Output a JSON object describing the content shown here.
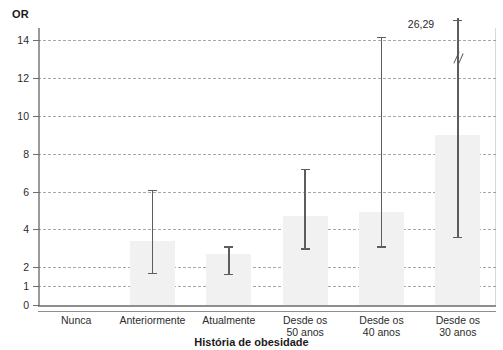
{
  "chart_data": {
    "type": "bar",
    "title": "",
    "subtitle": "",
    "xlabel": "História de obesidade",
    "ylabel": "OR",
    "ylim": [
      0,
      15
    ],
    "grid": true,
    "legend": "none",
    "yticks": [
      0,
      1,
      2,
      4,
      6,
      8,
      10,
      12,
      14
    ],
    "ytick_labels": [
      "0",
      "1",
      "2",
      "4",
      "6",
      "8",
      "10",
      "12",
      "14"
    ],
    "categories": [
      "Nunca",
      "Anteriormente",
      "Atualmente",
      "Desde os 50 anos",
      "Desde os 40 anos",
      "Desde os 30 anos"
    ],
    "category_lines": [
      [
        "Nunca"
      ],
      [
        "Anteriormente"
      ],
      [
        "Atualmente"
      ],
      [
        "Desde os",
        "50 anos"
      ],
      [
        "Desde os",
        "40 anos"
      ],
      [
        "Desde os",
        "30 anos"
      ]
    ],
    "values": [
      1.0,
      3.4,
      2.7,
      4.7,
      4.9,
      9.0
    ],
    "error_low": [
      null,
      1.7,
      1.65,
      3.0,
      3.1,
      3.6
    ],
    "error_high": [
      null,
      6.1,
      3.1,
      7.2,
      14.2,
      26.29
    ],
    "reference_category": "Nunca",
    "annotations": [
      {
        "text": "26,29",
        "category": "Desde os 30 anos",
        "value": 26.29
      }
    ],
    "axis_break": {
      "category": "Desde os 30 anos",
      "symbol": "double-slash",
      "at_value": 13.0
    }
  }
}
